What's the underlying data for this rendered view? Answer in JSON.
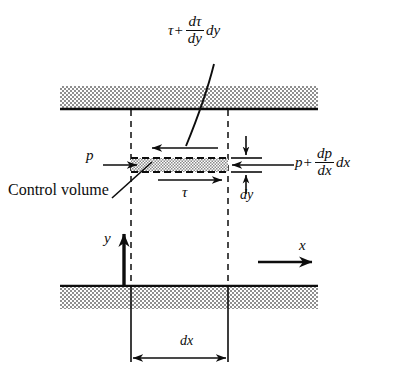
{
  "figure": {
    "type": "control-volume-diagram",
    "colors": {
      "ink": "#0d0d0d",
      "wall_fill": "#a8a8a8",
      "cv_fill": "#b4b4b4",
      "background": "#ffffff"
    }
  },
  "labels": {
    "control_volume": "Control volume",
    "tau": "τ",
    "dy": "dy",
    "dx": "dx",
    "y_axis": "y",
    "x_axis": "x"
  },
  "formulas": {
    "top_shear": {
      "lead": "τ",
      "operator": "+",
      "numerator": "dτ",
      "denominator": "dy",
      "trail": "dy",
      "plain": "τ + (dτ/dy) dy"
    },
    "right_pressure": {
      "lead": "p",
      "operator": "+",
      "numerator": "dp",
      "denominator": "dx",
      "trail": "dx",
      "plain": "p + (dp/dx) dx"
    },
    "left_pressure": {
      "lead": "p",
      "plain": "p"
    }
  },
  "geometry": {
    "top_wall": {
      "x": 60,
      "y": 86,
      "width": 258,
      "height": 23
    },
    "bottom_wall": {
      "x": 60,
      "y": 286,
      "width": 258,
      "height": 23
    },
    "cv": {
      "x": 131,
      "y": 158,
      "width": 97,
      "height": 14
    },
    "dashed_left_x": 131,
    "dashed_right_x": 228,
    "dash_top_y": 109,
    "dash_bottom_y": 286
  }
}
